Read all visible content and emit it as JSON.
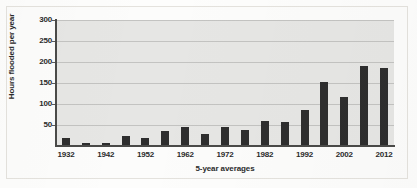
{
  "chart_data": {
    "type": "bar",
    "title": "",
    "xlabel": "5-year averages",
    "ylabel": "Hours flooded per year",
    "ylim": [
      0,
      300
    ],
    "xlim_categories_count": 17,
    "grid": true,
    "legend": "none",
    "bar_color": "#2e2e2e",
    "plot_background": "#e6e6e4",
    "ytick_labels": [
      "300",
      "250",
      "200",
      "150",
      "100",
      "50"
    ],
    "ytick_values": [
      300,
      250,
      200,
      150,
      100,
      50
    ],
    "categories": [
      "1932",
      "1937",
      "1942",
      "1947",
      "1952",
      "1957",
      "1962",
      "1967",
      "1972",
      "1977",
      "1982",
      "1987",
      "1992",
      "1997",
      "2002",
      "2007",
      "2012"
    ],
    "xtick_labels_shown": [
      "1932",
      "1942",
      "1952",
      "1962",
      "1972",
      "1982",
      "1992",
      "2002",
      "2012"
    ],
    "values": [
      18,
      7,
      6,
      25,
      18,
      35,
      45,
      28,
      45,
      37,
      60,
      56,
      85,
      153,
      116,
      191,
      185
    ]
  }
}
